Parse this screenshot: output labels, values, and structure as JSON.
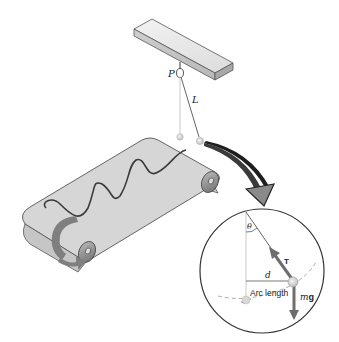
{
  "diagram": {
    "type": "physics-illustration",
    "labels": {
      "pivot": "P",
      "length": "L",
      "angle": "θ",
      "tension": "T",
      "displacement": "d",
      "arc": "Arc length",
      "weight_m": "m",
      "weight_g": "g"
    },
    "colors": {
      "belt": "#d4d4d4",
      "belt_edge": "#555555",
      "roller": "#8a8a8a",
      "arrow_gray": "#808080",
      "force_arrow": "#6e6e6e",
      "outline": "#333333",
      "background": "#ffffff"
    }
  }
}
